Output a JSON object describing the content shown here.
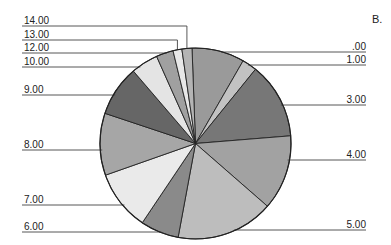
{
  "panel_label": "B.",
  "chart_data": {
    "type": "pie",
    "title": "",
    "panel": "B.",
    "start_angle_deg": -2.1,
    "direction": "clockwise",
    "center": [
      195.5,
      143.5
    ],
    "radius": 95.5,
    "slices": [
      {
        "label": ".00",
        "value": 8.9,
        "color": "#9a9a9a",
        "side": "right",
        "label_y": 52
      },
      {
        "label": "1.00",
        "value": 2.5,
        "color": "#c2c2c2",
        "side": "right",
        "label_y": 65
      },
      {
        "label": "3.00",
        "value": 12.9,
        "color": "#777777",
        "side": "right",
        "label_y": 105
      },
      {
        "label": "4.00",
        "value": 12.7,
        "color": "#a2a2a2",
        "side": "right",
        "label_y": 160
      },
      {
        "label": "5.00",
        "value": 16.5,
        "color": "#bdbdbd",
        "side": "right",
        "label_y": 230
      },
      {
        "label": "6.00",
        "value": 6.5,
        "color": "#8a8a8a",
        "side": "left",
        "label_y": 232
      },
      {
        "label": "7.00",
        "value": 10.2,
        "color": "#eaeaea",
        "side": "left",
        "label_y": 205
      },
      {
        "label": "8.00",
        "value": 10.5,
        "color": "#a6a6a6",
        "side": "left",
        "label_y": 150
      },
      {
        "label": "9.00",
        "value": 8.6,
        "color": "#666666",
        "side": "left",
        "label_y": 95
      },
      {
        "label": "10.00",
        "value": 4.6,
        "color": "#e4e4e4",
        "side": "left",
        "label_y": 67
      },
      {
        "label": "12.00",
        "value": 2.9,
        "color": "#a0a0a0",
        "side": "left",
        "label_y": 53
      },
      {
        "label": "13.00",
        "value": 1.5,
        "color": "#e8e8e8",
        "side": "left",
        "label_y": 40
      },
      {
        "label": "14.00",
        "value": 1.7,
        "color": "#b4b4b4",
        "side": "left",
        "label_y": 26
      }
    ],
    "label_line": {
      "left_x": 22,
      "right_x": 366,
      "color": "#444444"
    },
    "legend": "none (leader-line labels)",
    "units": "percent of whole (estimated from slice angles)"
  }
}
